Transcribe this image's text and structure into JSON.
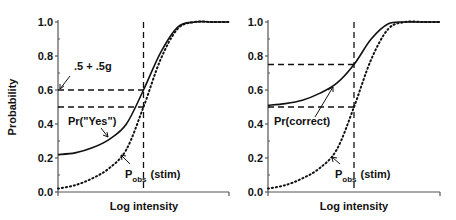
{
  "chart_data": [
    {
      "type": "line",
      "title": "",
      "xlabel": "Log intensity",
      "ylabel": "Probability",
      "ylim": [
        0,
        1
      ],
      "yticks": [
        "0.0",
        "0.2",
        "0.4",
        "0.6",
        "0.8",
        "1.0"
      ],
      "xlim": [
        0,
        1
      ],
      "grid": false,
      "series": [
        {
          "name": "Pr(\"Yes\")",
          "style": "solid",
          "guess_rate": 0.2,
          "x": [
            0,
            0.1,
            0.2,
            0.3,
            0.4,
            0.5,
            0.6,
            0.7,
            0.8,
            0.9,
            1.0
          ],
          "y": [
            0.22,
            0.23,
            0.26,
            0.31,
            0.4,
            0.6,
            0.82,
            0.97,
            1.0,
            1.0,
            1.0
          ]
        },
        {
          "name": "Pobs(stim)",
          "style": "dotted",
          "x": [
            0,
            0.1,
            0.2,
            0.3,
            0.4,
            0.5,
            0.6,
            0.7,
            0.8,
            0.9,
            1.0
          ],
          "y": [
            0.02,
            0.04,
            0.08,
            0.14,
            0.25,
            0.5,
            0.78,
            0.96,
            1.0,
            1.0,
            1.0
          ]
        }
      ],
      "reference_lines": {
        "threshold_x": 0.5,
        "h_levels": [
          0.6,
          0.5
        ]
      },
      "annotations": [
        {
          "text": ".5 + .5g",
          "points_to": 0.6
        },
        {
          "text": "Pr(\"Yes\")",
          "points_to": "solid"
        },
        {
          "text": "P",
          "subscript": "obs",
          "suffix": "(stim)",
          "points_to": "dotted"
        }
      ]
    },
    {
      "type": "line",
      "title": "",
      "xlabel": "Log intensity",
      "ylabel": "",
      "ylim": [
        0,
        1
      ],
      "yticks": [
        "0.0",
        "0.2",
        "0.4",
        "0.6",
        "0.8",
        "1.0"
      ],
      "xlim": [
        0,
        1
      ],
      "grid": false,
      "series": [
        {
          "name": "Pr(correct)",
          "style": "solid",
          "x": [
            0,
            0.1,
            0.2,
            0.3,
            0.4,
            0.5,
            0.6,
            0.7,
            0.8,
            0.9,
            1.0
          ],
          "y": [
            0.51,
            0.52,
            0.54,
            0.58,
            0.64,
            0.75,
            0.9,
            0.99,
            1.0,
            1.0,
            1.0
          ]
        },
        {
          "name": "Pobs(stim)",
          "style": "dotted",
          "x": [
            0,
            0.1,
            0.2,
            0.3,
            0.4,
            0.5,
            0.6,
            0.7,
            0.8,
            0.9,
            1.0
          ],
          "y": [
            0.02,
            0.04,
            0.08,
            0.14,
            0.25,
            0.5,
            0.78,
            0.96,
            1.0,
            1.0,
            1.0
          ]
        }
      ],
      "reference_lines": {
        "threshold_x": 0.5,
        "h_levels": [
          0.75,
          0.5
        ]
      },
      "annotations": [
        {
          "text": "Pr(correct)",
          "points_to": "solid"
        },
        {
          "text": "P",
          "subscript": "obs",
          "suffix": "(stim)",
          "points_to": "dotted"
        }
      ]
    }
  ]
}
